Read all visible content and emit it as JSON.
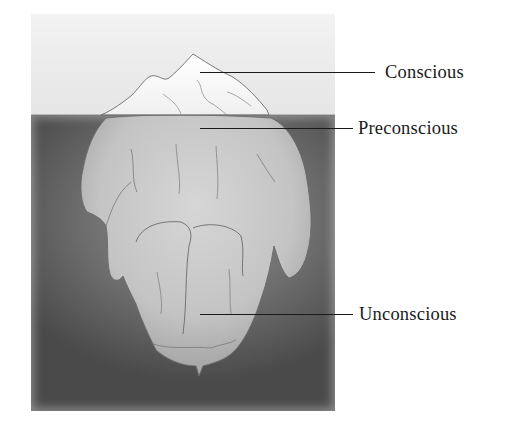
{
  "figure": {
    "colors": {
      "sky": "#ececec",
      "water_light": "#8f8f8f",
      "water_dark": "#4a4a4a",
      "ice_above": "#f7f7f7",
      "ice_below": "#c9c9c9",
      "ice_outline": "#6a6a6a",
      "leader_line": "#1a1a1a"
    }
  },
  "labels": [
    {
      "id": "conscious",
      "text": "Conscious",
      "region": "tip above waterline"
    },
    {
      "id": "preconscious",
      "text": "Preconscious",
      "region": "just below waterline"
    },
    {
      "id": "unconscious",
      "text": "Unconscious",
      "region": "deep submerged mass"
    }
  ]
}
